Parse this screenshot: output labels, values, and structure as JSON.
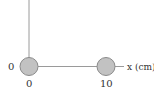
{
  "diagram": {
    "axis_label_x": "x (cm)",
    "origin_label": "0",
    "tick_labels": [
      "0",
      "10"
    ],
    "charges": [
      {
        "name": "charge-1",
        "position_cm": 0
      },
      {
        "name": "charge-2",
        "position_cm": 10
      }
    ],
    "colors": {
      "sphere_fill": "#c2c2c2",
      "sphere_stroke": "#8a8a8a",
      "axis": "#9a9a9a",
      "text": "#333333"
    }
  }
}
